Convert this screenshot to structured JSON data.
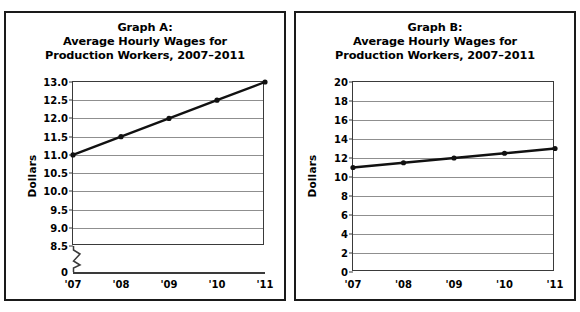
{
  "figure": {
    "panel_count": 2,
    "background_color": "#ffffff",
    "border_color": "#1a1a1a"
  },
  "chart_data": [
    {
      "id": "graph-a",
      "type": "line",
      "title": "Graph A:\nAverage Hourly Wages for\nProduction Workers, 2007–2011",
      "title_lines": [
        "Graph A:",
        "Average Hourly Wages for",
        "Production Workers, 2007–2011"
      ],
      "xlabel": "",
      "ylabel": "Dollars",
      "categories": [
        "'07",
        "'08",
        "'09",
        "'10",
        "'11"
      ],
      "x": [
        2007,
        2008,
        2009,
        2010,
        2011
      ],
      "values": [
        11.0,
        11.5,
        12.0,
        12.5,
        13.0
      ],
      "ylim": [
        8.5,
        13.0
      ],
      "yticks": [
        8.5,
        9.0,
        9.5,
        10.0,
        10.5,
        11.0,
        11.5,
        12.0,
        12.5,
        13.0
      ],
      "ytick_labels": [
        "8.5",
        "9.0",
        "9.5",
        "10.0",
        "10.5",
        "11.0",
        "11.5",
        "12.0",
        "12.5",
        "13.0"
      ],
      "axis_break": true,
      "axis_break_label": "0",
      "grid": true,
      "grid_color": "#8f8f8f",
      "legend": "none",
      "line_color": "#111111",
      "marker": "circle",
      "marker_color": "#111111"
    },
    {
      "id": "graph-b",
      "type": "line",
      "title": "Graph B:\nAverage Hourly Wages for\nProduction Workers, 2007–2011",
      "title_lines": [
        "Graph B:",
        "Average Hourly Wages for",
        "Production Workers, 2007–2011"
      ],
      "xlabel": "",
      "ylabel": "Dollars",
      "categories": [
        "'07",
        "'08",
        "'09",
        "'10",
        "'11"
      ],
      "x": [
        2007,
        2008,
        2009,
        2010,
        2011
      ],
      "values": [
        11.0,
        11.5,
        12.0,
        12.5,
        13.0
      ],
      "ylim": [
        0,
        20
      ],
      "yticks": [
        0,
        2,
        4,
        6,
        8,
        10,
        12,
        14,
        16,
        18,
        20
      ],
      "ytick_labels": [
        "0",
        "2",
        "4",
        "6",
        "8",
        "10",
        "12",
        "14",
        "16",
        "18",
        "20"
      ],
      "axis_break": false,
      "grid": true,
      "grid_color": "#8f8f8f",
      "legend": "none",
      "line_color": "#111111",
      "marker": "circle",
      "marker_color": "#111111"
    }
  ]
}
